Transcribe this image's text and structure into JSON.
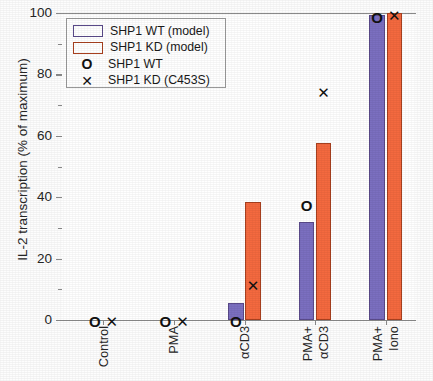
{
  "chart_data": {
    "type": "bar",
    "title": "",
    "xlabel": "",
    "ylabel": "IL-2 transcription (% of maximum)",
    "ylim": [
      0,
      100
    ],
    "yticks": [
      0,
      20,
      40,
      60,
      80,
      100
    ],
    "ytick_labels": [
      "0",
      "20",
      "40",
      "60",
      "80",
      "100"
    ],
    "grid": false,
    "legend_position": "upper left",
    "categories": [
      "Control",
      "PMA",
      "αCD3",
      "PMA+αCD3",
      "PMA+Iono"
    ],
    "category_lines": [
      [
        "Control"
      ],
      [
        "PMA"
      ],
      [
        "αCD3"
      ],
      [
        "PMA+",
        "αCD3"
      ],
      [
        "PMA+",
        "Iono"
      ]
    ],
    "series": [
      {
        "name": "SHP1 WT (model)",
        "kind": "bar",
        "color": "#7b6fc0",
        "values": [
          0,
          0,
          5.5,
          32,
          99.5
        ]
      },
      {
        "name": "SHP1 KD (model)",
        "kind": "bar",
        "color": "#f4693f",
        "values": [
          0,
          0,
          38.5,
          57.5,
          100
        ]
      },
      {
        "name": "SHP1 WT",
        "kind": "marker",
        "marker": "circle",
        "color": "#111111",
        "values": [
          0,
          0,
          0,
          37.5,
          99
        ]
      },
      {
        "name": "SHP1 KD (C453S)",
        "kind": "marker",
        "marker": "cross",
        "color": "#111111",
        "values": [
          0,
          0,
          11.5,
          74.5,
          99.5
        ]
      }
    ]
  },
  "legend": {
    "entries": [
      {
        "label": "SHP1 WT (model)",
        "symbol": "swatch-purple"
      },
      {
        "label": "SHP1 KD (model)",
        "symbol": "swatch-orange"
      },
      {
        "label": "SHP1 WT",
        "symbol": "circle-marker",
        "glyph": "O"
      },
      {
        "label": "SHP1 KD (C453S)",
        "symbol": "cross-marker",
        "glyph": "✕"
      }
    ]
  },
  "colors": {
    "wt_model": "#7b6fc0",
    "kd_model": "#f4693f",
    "marker": "#111111",
    "axis": "#8a8a8a"
  }
}
